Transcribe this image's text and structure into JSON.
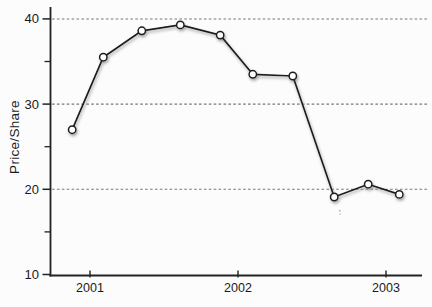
{
  "figure": {
    "background": "#fcfcfc"
  },
  "chart_data": {
    "type": "line",
    "title": "",
    "xlabel": "",
    "ylabel": "Price/Share",
    "x_tick_labels": [
      "2001",
      "2002",
      "2003"
    ],
    "x_tick_values": [
      2001,
      2002,
      2003
    ],
    "y_ticks_major": [
      10,
      20,
      30,
      40
    ],
    "y_tick_labels": [
      "10",
      "20",
      "30",
      "40"
    ],
    "y_ticks_minor": [
      15,
      25,
      35
    ],
    "gridlines_at_y": [
      20,
      30,
      40
    ],
    "gridline_style": "dashed",
    "grid_on": true,
    "legend": "none",
    "xlim": [
      2000.73,
      2003.24
    ],
    "ylim": [
      10,
      41.4
    ],
    "series": [
      {
        "name": "price-per-share",
        "marker": "open-circle",
        "marker_fill": "#ffffff",
        "line_color": "#1b1b1b",
        "x": [
          2000.88,
          2001.09,
          2001.35,
          2001.61,
          2001.88,
          2002.1,
          2002.37,
          2002.65,
          2002.88,
          2003.09
        ],
        "values": [
          27.0,
          35.5,
          38.6,
          39.3,
          38.1,
          33.5,
          33.3,
          19.1,
          20.6,
          19.4
        ]
      }
    ],
    "colors": {
      "axis": "#222222",
      "grid": "#777777",
      "text": "#1a1a1a",
      "shadow": "#8c8c8c",
      "line": "#1b1b1b"
    }
  }
}
